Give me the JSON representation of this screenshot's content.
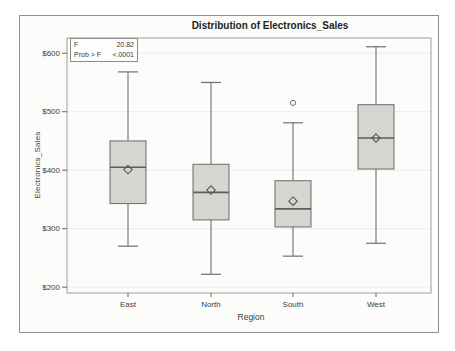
{
  "panel_title": "Distribution of Electronics_Sales",
  "chart_data": {
    "type": "boxplot",
    "title": "Distribution of Electronics_Sales",
    "xlabel": "Region",
    "ylabel": "Electronics_Sales",
    "categories": [
      "East",
      "North",
      "South",
      "West"
    ],
    "y_ticks": [
      200,
      300,
      400,
      500,
      600
    ],
    "y_tick_prefix": "$",
    "ylim": [
      190,
      626
    ],
    "grid": true,
    "legend": "none",
    "series": [
      {
        "category": "East",
        "whisker_low": 270,
        "q1": 343,
        "median": 405,
        "mean": 401,
        "q3": 450,
        "whisker_high": 568,
        "outliers": []
      },
      {
        "category": "North",
        "whisker_low": 222,
        "q1": 315,
        "median": 362,
        "mean": 366,
        "q3": 410,
        "whisker_high": 550,
        "outliers": []
      },
      {
        "category": "South",
        "whisker_low": 253,
        "q1": 303,
        "median": 334,
        "mean": 347,
        "q3": 382,
        "whisker_high": 481,
        "outliers": [
          515
        ]
      },
      {
        "category": "West",
        "whisker_low": 275,
        "q1": 402,
        "median": 455,
        "mean": 455,
        "q3": 512,
        "whisker_high": 611,
        "outliers": []
      }
    ],
    "annotations": [
      {
        "label": "F",
        "value": "20.82"
      },
      {
        "label": "Prob > F",
        "value": "<.0001"
      }
    ]
  },
  "colors": {
    "frame_bg": "#fcfcfa",
    "frame_border": "#8f8f8f",
    "plot_wall": "#9c9c9c",
    "grid_line": "#ecece8",
    "box_fill": "#d5d5d2",
    "box_stroke": "#757575",
    "median_line": "#5c5c5c",
    "whisker": "#6f6f6f",
    "mean_marker": "#565656",
    "outlier": "#6f6f6f",
    "tick": "#666666",
    "tick_text": "#3d3d3d",
    "title_text": "#1c1c1c"
  }
}
